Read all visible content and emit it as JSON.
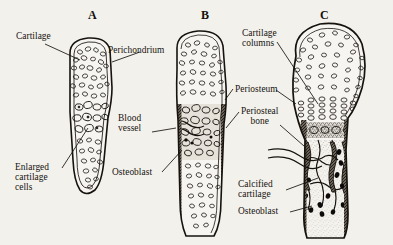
{
  "figure": {
    "background_color": "#f3f1ec",
    "ink_color": "#16130f",
    "stages": [
      {
        "letter": "A",
        "x": 88,
        "y": 8
      },
      {
        "letter": "B",
        "x": 201,
        "y": 8
      },
      {
        "letter": "C",
        "x": 320,
        "y": 8
      }
    ]
  },
  "labels": {
    "cartilage": "Cartilage",
    "perichondrium": "Perichondrium",
    "enlarged_cartilage_cells": "Enlarged\ncartilage\ncells",
    "osteoblast_left": "Osteoblast",
    "blood_vessel": "Blood\nvessel",
    "cartilage_columns": "Cartilage\ncolumns",
    "periosteum": "Periosteum",
    "periosteal_bone": "Periosteal\nbone",
    "calcified_cartilage": "Calcified\ncartilage",
    "osteoblast_right": "Osteoblast"
  }
}
